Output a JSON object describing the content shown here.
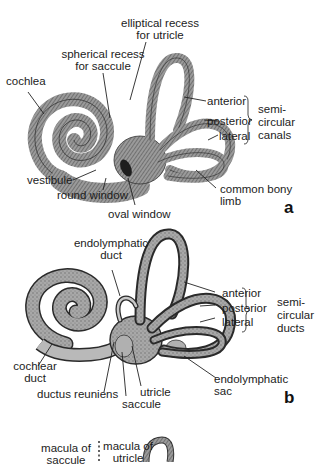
{
  "panels": [
    {
      "letter": "a",
      "labels": {
        "elliptical_recess_1": "elliptical recess",
        "elliptical_recess_2": "for utricle",
        "spherical_recess_1": "spherical recess",
        "spherical_recess_2": "for saccule",
        "cochlea": "cochlea",
        "anterior": "anterior",
        "posterior": "posterior",
        "lateral": "lateral",
        "group_1": "semi-",
        "group_2": "circular",
        "group_3": "canals",
        "vestibule": "vestibule",
        "round_window": "round window",
        "oval_window": "oval window",
        "common_bony_limb_1": "common bony",
        "common_bony_limb_2": "limb"
      }
    },
    {
      "letter": "b",
      "labels": {
        "endolymphatic_duct_1": "endolymphatic",
        "endolymphatic_duct_2": "duct",
        "anterior": "anterior",
        "posterior": "posterior",
        "lateral": "lateral",
        "group_1": "semi-",
        "group_2": "circular",
        "group_3": "ducts",
        "cochlear_duct_1": "cochlear",
        "cochlear_duct_2": "duct",
        "ductus_reuniens": "ductus reuniens",
        "utricle": "utricle",
        "saccule": "saccule",
        "endolymphatic_sac_1": "endolymphatic",
        "endolymphatic_sac_2": "sac"
      }
    },
    {
      "letter": "c",
      "labels": {
        "macula_saccule_1": "macula of",
        "macula_saccule_2": "saccule",
        "macula_utricle_1": "macula of",
        "macula_utricle_2": "utricle"
      }
    }
  ],
  "colors": {
    "bone_fill": "#8a8a8a",
    "bone_dark": "#4a4a4a",
    "membrane_fill": "#9c9c9c",
    "membrane_light": "#c4c4c4",
    "outline": "#2a2a2a"
  }
}
